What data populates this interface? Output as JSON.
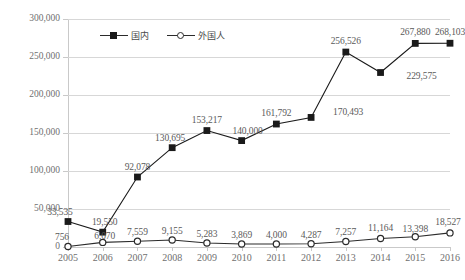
{
  "chart_data": {
    "type": "line",
    "title": "",
    "subtitle": "",
    "xlabel": "",
    "ylabel": "",
    "categories": [
      "2005",
      "2006",
      "2007",
      "2008",
      "2009",
      "2010",
      "2011",
      "2012",
      "2013",
      "2014",
      "2015",
      "2016"
    ],
    "ylim": [
      0,
      300000
    ],
    "yticks": [
      0,
      50000,
      100000,
      150000,
      200000,
      250000,
      300000
    ],
    "ytick_labels": [
      "0",
      "50,000",
      "100,000",
      "150,000",
      "200,000",
      "250,000",
      "300,000"
    ],
    "grid": true,
    "legend_position": "top-left-inside",
    "series": [
      {
        "name": "国内",
        "marker": "filled-square",
        "color": "#1a1a1a",
        "values": [
          33535,
          19550,
          92078,
          130695,
          153217,
          140000,
          161792,
          170493,
          256526,
          229575,
          267880,
          268103
        ],
        "labels": [
          "33,535",
          "19,550",
          "92,078",
          "130,695",
          "153,217",
          "140,000",
          "161,792",
          "170,493",
          "256,526",
          "229,575",
          "267,880",
          "268,103"
        ]
      },
      {
        "name": "外国人",
        "marker": "open-circle",
        "color": "#2b2b2b",
        "values": [
          756,
          6070,
          7559,
          9155,
          5283,
          3869,
          4000,
          4287,
          7257,
          11164,
          13398,
          18527
        ],
        "labels": [
          "756",
          "6,070",
          "7,559",
          "9,155",
          "5,283",
          "3,869",
          "4,000",
          "4,287",
          "7,257",
          "11,164",
          "13,398",
          "18,527"
        ]
      }
    ]
  },
  "legend": {
    "items": [
      {
        "label": "国内"
      },
      {
        "label": "外国人"
      }
    ]
  }
}
